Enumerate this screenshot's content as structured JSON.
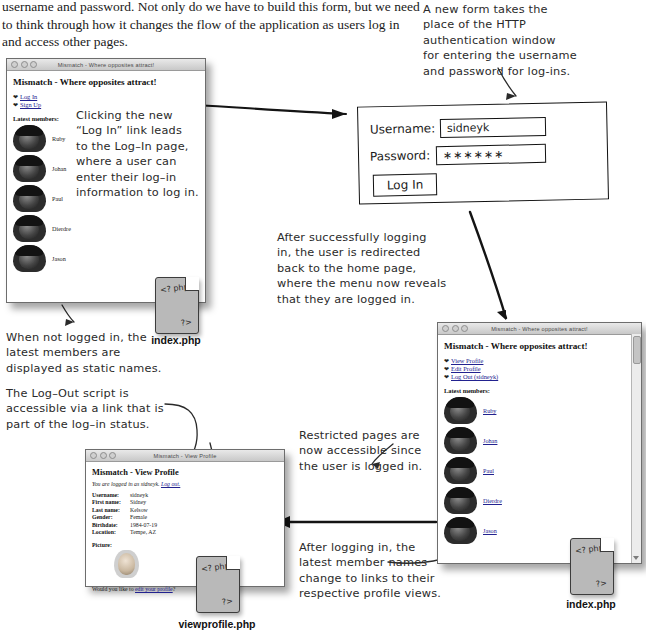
{
  "intro_paragraph": "username and password. Not only do we have to build this form, but we need to think through how it changes the flow of the application as users log in and access other pages.",
  "annotations": {
    "top_right": "A new form takes the\nplace of the HTTP\nauthentication window\nfor entering the username\nand password for log-ins.",
    "login_link": "Clicking the new\n“Log In” link leads\nto the Log–In page,\nwhere a user can\nenter their log–in\ninformation to log in.",
    "after_login": "After successfully logging\nin, the user is redirected\nback to the home page,\nwhere the menu now reveals\nthat they are logged in.",
    "static_names": "When not logged in, the\nlatest members are\ndisplayed as static names.",
    "logout_script": "The Log–Out script is\naccessible via a link that is\npart of the log–in status.",
    "nav_menu": "The main\nnavigation menu\nincludes a Log\nOut link that\nalso shows the\nusername of the\nlogged in user.",
    "restricted_pages": "Restricted pages are\nnow accessible since\nthe user is logged in.",
    "member_links": "After logging in, the\nlatest member names\nchange to links to their\nrespective profile views."
  },
  "window_logged_out": {
    "title": "Mismatch - Where opposites attract!",
    "heading": "Mismatch - Where opposites attract!",
    "nav": [
      {
        "label": "Log In"
      },
      {
        "label": "Sign Up"
      }
    ],
    "latest_label": "Latest members:",
    "members": [
      {
        "name": "Ruby"
      },
      {
        "name": "Johan"
      },
      {
        "name": "Paul"
      },
      {
        "name": "Dierdre"
      },
      {
        "name": "Jason"
      }
    ]
  },
  "window_logged_in": {
    "title": "Mismatch - Where opposites attract!",
    "heading": "Mismatch - Where opposites attract!",
    "nav": [
      {
        "label": "View Profile"
      },
      {
        "label": "Edit Profile"
      },
      {
        "label": "Log Out (sidneyk)"
      }
    ],
    "latest_label": "Latest members:",
    "members": [
      {
        "name": "Ruby"
      },
      {
        "name": "Johan"
      },
      {
        "name": "Paul"
      },
      {
        "name": "Dierdre"
      },
      {
        "name": "Jason"
      }
    ]
  },
  "login_form": {
    "username_label": "Username:",
    "username_value": "sidneyk",
    "password_label": "Password:",
    "password_value": "∗∗∗∗∗∗",
    "submit_label": "Log In"
  },
  "profile_window": {
    "title": "Mismatch - View Profile",
    "heading": "Mismatch - View Profile",
    "status_prefix": "You are logged in as sidneyk. ",
    "status_link": "Log out.",
    "fields": [
      {
        "key": "Username:",
        "value": "sidneyk"
      },
      {
        "key": "First name:",
        "value": "Sidney"
      },
      {
        "key": "Last name:",
        "value": "Kelsow"
      },
      {
        "key": "Gender:",
        "value": "Female"
      },
      {
        "key": "Birthdate:",
        "value": "1984-07-19"
      },
      {
        "key": "Location:",
        "value": "Tempe, AZ"
      }
    ],
    "picture_label": "Picture:",
    "edit_prefix": "Would you like to ",
    "edit_link": "edit your profile",
    "edit_suffix": "?"
  },
  "files": {
    "php_open": "<? php",
    "php_close": "?>",
    "index_label_top": "index.php",
    "index_label_bottom": "index.php",
    "viewprofile_label": "viewprofile.php"
  }
}
